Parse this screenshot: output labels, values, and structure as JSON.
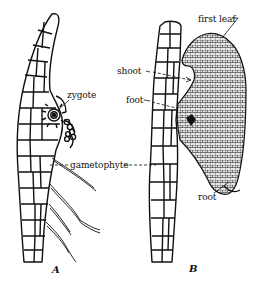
{
  "figure": {
    "panels": [
      {
        "id": "A",
        "letter": "A"
      },
      {
        "id": "B",
        "letter": "B"
      }
    ],
    "labels": {
      "zygote": "zygote",
      "shoot": "shoot",
      "foot": "foot",
      "first_leaf": "first leaf",
      "gametophyte": "gametophyte",
      "root": "root"
    },
    "colors": {
      "ink": "#111111",
      "background": "#ffffff",
      "sporophyte_fill": "#cfcfcf"
    }
  }
}
